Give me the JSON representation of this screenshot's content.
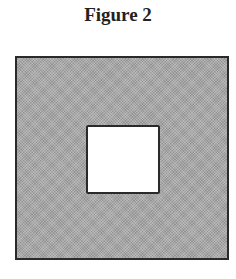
{
  "figure": {
    "title": "Figure 2",
    "outer_square": {
      "fill": "#a8a8a8",
      "border": "#2a2a2a",
      "description": "large shaded square"
    },
    "inner_square": {
      "fill": "#ffffff",
      "border": "#2a2a2a",
      "description": "small unshaded square centered inside"
    }
  }
}
